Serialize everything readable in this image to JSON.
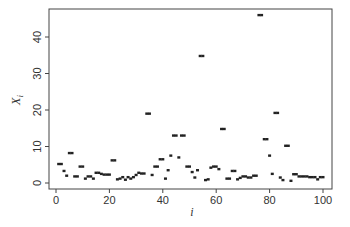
{
  "chart_data": {
    "type": "scatter",
    "title": "",
    "xlabel": "i",
    "ylabel": "X_i",
    "xlim": [
      0,
      100
    ],
    "ylim": [
      0,
      47
    ],
    "xticks": [
      0,
      20,
      40,
      60,
      80,
      100
    ],
    "yticks": [
      0,
      10,
      20,
      30,
      40
    ],
    "grid": false,
    "legend": null,
    "marker": "small filled square",
    "x": [
      1,
      2,
      3,
      4,
      5,
      6,
      7,
      8,
      9,
      10,
      11,
      12,
      13,
      14,
      15,
      16,
      17,
      18,
      19,
      20,
      21,
      22,
      23,
      24,
      25,
      26,
      27,
      28,
      29,
      30,
      31,
      32,
      33,
      34,
      35,
      36,
      37,
      38,
      39,
      40,
      41,
      42,
      43,
      44,
      45,
      46,
      47,
      48,
      49,
      50,
      51,
      52,
      53,
      54,
      55,
      56,
      57,
      58,
      59,
      60,
      61,
      62,
      63,
      64,
      65,
      66,
      67,
      68,
      69,
      70,
      71,
      72,
      73,
      74,
      75,
      76,
      77,
      78,
      79,
      80,
      81,
      82,
      83,
      84,
      85,
      86,
      87,
      88,
      89,
      90,
      91,
      92,
      93,
      94,
      95,
      96,
      97,
      98,
      99,
      100
    ],
    "y": [
      5.2,
      5.2,
      3.3,
      2.0,
      8.2,
      8.2,
      1.8,
      1.8,
      4.5,
      4.5,
      1.2,
      1.8,
      1.8,
      1.2,
      2.8,
      2.8,
      2.5,
      2.3,
      2.3,
      2.3,
      6.2,
      6.2,
      1.0,
      1.2,
      1.6,
      0.9,
      1.6,
      1.2,
      1.6,
      2.2,
      2.8,
      2.6,
      2.6,
      19.0,
      19.0,
      2.2,
      4.5,
      4.5,
      6.5,
      6.5,
      1.2,
      3.5,
      7.5,
      13.0,
      13.0,
      7.0,
      13.0,
      13.0,
      4.5,
      4.5,
      3.0,
      1.5,
      3.5,
      34.8,
      34.8,
      0.8,
      1.0,
      4.2,
      4.5,
      4.5,
      3.8,
      14.8,
      14.8,
      1.2,
      1.2,
      3.3,
      3.3,
      1.0,
      1.4,
      1.8,
      1.8,
      1.5,
      1.5,
      2.0,
      2.0,
      46.0,
      46.0,
      12.0,
      12.0,
      7.5,
      2.5,
      19.2,
      19.2,
      1.5,
      0.8,
      10.2,
      10.2,
      0.6,
      2.4,
      2.4,
      1.8,
      1.8,
      1.8,
      1.8,
      1.6,
      1.6,
      1.6,
      1.0,
      1.6,
      1.6
    ]
  },
  "axes": {
    "xlabel": "i",
    "ylabel_base": "X",
    "ylabel_sub": "i",
    "xtick_labels": [
      "0",
      "20",
      "40",
      "60",
      "80",
      "100"
    ],
    "ytick_labels": [
      "0",
      "10",
      "20",
      "30",
      "40"
    ]
  }
}
